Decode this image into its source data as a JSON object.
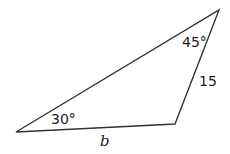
{
  "diagram": {
    "type": "triangle",
    "stroke_color": "#333333",
    "vertices": {
      "left": [
        16,
        132
      ],
      "bottom_right": [
        175,
        124
      ],
      "top": [
        219,
        10
      ]
    },
    "labels": {
      "angle_left": "30°",
      "angle_top": "45°",
      "side_right": "15",
      "side_bottom": "b"
    }
  }
}
